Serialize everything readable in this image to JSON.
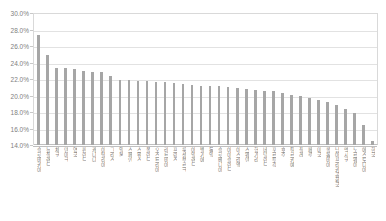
{
  "chart_data": {
    "type": "bar",
    "title": "",
    "subtitle": "",
    "xlabel": "",
    "ylabel": "",
    "ylim": [
      14.0,
      30.0
    ],
    "ytick_step": 2.0,
    "ytick_labels": [
      "30.0%",
      "28.0%",
      "26.0%",
      "24.0%",
      "22.0%",
      "20.0%",
      "18.0%",
      "16.0%",
      "14.0%"
    ],
    "ytick_values": [
      30.0,
      28.0,
      26.0,
      24.0,
      22.0,
      20.0,
      18.0,
      16.0,
      14.0
    ],
    "grid": true,
    "legend": false,
    "bar_color": "#a6a6a6",
    "grid_color": "#e2e2e2",
    "axis_color": "#bfbfbf",
    "label_color": "#808080",
    "categories": [
      "슬로바키아",
      "뉴질랜드",
      "체코",
      "덴마크",
      "영국",
      "핀란드",
      "캐나다",
      "이탈리아",
      "그리스",
      "일본",
      "스페인",
      "스위스",
      "폴란드",
      "오스트리아",
      "라트비아",
      "프랑스",
      "룩셈부르크",
      "아일랜드",
      "벨기에",
      "독일",
      "슬로베니아",
      "아이슬란드",
      "이스라엘",
      "스웨덴",
      "헝가리",
      "네덜란드",
      "포르투갈",
      "호주",
      "튀르키예",
      "칠레",
      "페루",
      "미국",
      "콜롬비아",
      "남아프리카공화국",
      "멕시코",
      "노르웨이",
      "에스토니아",
      "한국"
    ],
    "values": [
      27.3,
      24.9,
      23.3,
      23.3,
      23.2,
      23.0,
      22.9,
      22.8,
      22.4,
      21.9,
      21.9,
      21.8,
      21.8,
      21.6,
      21.6,
      21.5,
      21.4,
      21.3,
      21.2,
      21.2,
      21.1,
      21.0,
      20.9,
      20.8,
      20.7,
      20.6,
      20.5,
      20.3,
      20.1,
      19.9,
      19.7,
      19.4,
      19.2,
      18.9,
      18.4,
      17.9,
      16.4,
      14.5
    ]
  }
}
